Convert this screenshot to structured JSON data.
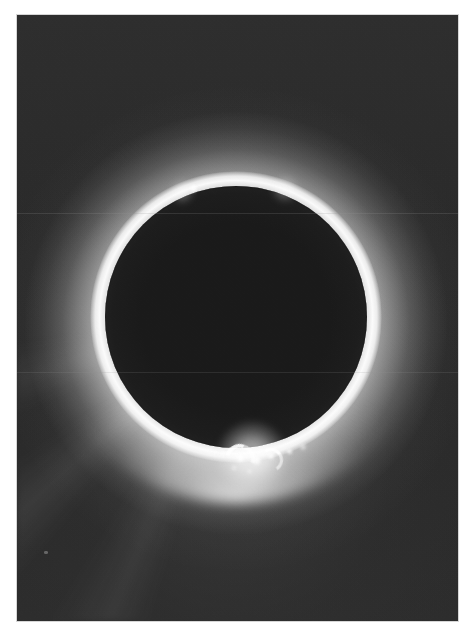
{
  "page": {
    "background_color": "#ffffff",
    "width": 473,
    "height": 639,
    "caption": ""
  },
  "plate": {
    "label": "Total solar eclipse photographic plate",
    "medium": "black-and-white photograph",
    "border_color": "#d6d6d6",
    "sky_color": "#2b2b2b",
    "frame": {
      "x": 17,
      "y": 15,
      "width": 441,
      "height": 606
    }
  },
  "eclipse": {
    "moon_disk": {
      "label": "Occulting lunar disk",
      "color": "#1a1a1a",
      "center_x": 236,
      "center_y": 317,
      "radius": 131
    },
    "corona": {
      "label": "Solar corona",
      "color": "#ffffff",
      "inner_rim_color": "#ffffff",
      "outer_extent_radius": 245,
      "brightest_position": "bottom"
    },
    "streamers": {
      "label": "Coronal streamers",
      "direction": "bottom-left fan"
    }
  },
  "prominences": [
    {
      "name": "top-limb-prominence",
      "x": 193,
      "y": 188,
      "size": 9,
      "brightness": "bright",
      "blur": "soft"
    },
    {
      "name": "top-limb-glow-left",
      "x": 182,
      "y": 192,
      "size": 26,
      "brightness": "faint",
      "blur": "vsoft"
    },
    {
      "name": "top-limb-glow-right",
      "x": 285,
      "y": 189,
      "size": 30,
      "brightness": "faint",
      "blur": "vsoft"
    },
    {
      "name": "bottom-knot-a",
      "x": 223,
      "y": 453,
      "size": 7,
      "brightness": "bright",
      "blur": "soft"
    },
    {
      "name": "bottom-knot-b",
      "x": 240,
      "y": 458,
      "size": 9,
      "brightness": "bright",
      "blur": "soft"
    },
    {
      "name": "bottom-knot-c",
      "x": 256,
      "y": 460,
      "size": 11,
      "brightness": "bright",
      "blur": "soft"
    },
    {
      "name": "bottom-knot-d",
      "x": 271,
      "y": 456,
      "size": 8,
      "brightness": "bright",
      "blur": "soft"
    },
    {
      "name": "bottom-knot-e",
      "x": 289,
      "y": 451,
      "size": 7,
      "brightness": "bright",
      "blur": "soft"
    },
    {
      "name": "bottom-knot-f",
      "x": 234,
      "y": 468,
      "size": 6,
      "brightness": "medium",
      "blur": "soft"
    },
    {
      "name": "bottom-knot-g",
      "x": 249,
      "y": 471,
      "size": 5,
      "brightness": "medium",
      "blur": "soft"
    },
    {
      "name": "bottom-knot-h",
      "x": 303,
      "y": 447,
      "size": 8,
      "brightness": "medium",
      "blur": "soft"
    },
    {
      "name": "bottom-knot-i",
      "x": 209,
      "y": 449,
      "size": 5,
      "brightness": "medium",
      "blur": "soft"
    },
    {
      "name": "bottom-base-glow",
      "x": 252,
      "y": 456,
      "size": 74,
      "brightness": "medium",
      "blur": "vsoft"
    }
  ],
  "prominence_loops": [
    {
      "name": "prominence-arc-left",
      "x": 236,
      "y": 455,
      "size": 22,
      "rotation": -28
    },
    {
      "name": "prominence-arc-right",
      "x": 268,
      "y": 457,
      "size": 18,
      "rotation": 12
    }
  ],
  "scanlines": [
    {
      "name": "plate-scanline-upper",
      "y": 213,
      "opacity": 0.2
    },
    {
      "name": "plate-scanline-lower",
      "y": 372,
      "opacity": 0.17
    }
  ],
  "specks": [
    {
      "name": "plate-blemish-lower-left",
      "x": 44,
      "y": 551,
      "width": 4,
      "height": 3
    }
  ]
}
